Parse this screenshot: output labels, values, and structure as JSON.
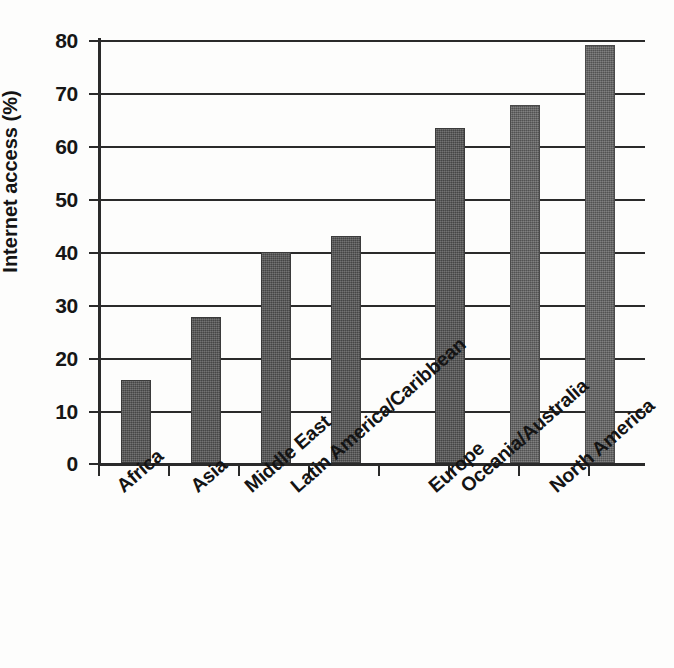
{
  "chart_data": {
    "type": "bar",
    "title": "",
    "subtitle": "",
    "xlabel": "",
    "ylabel": "Internet access (%)",
    "categories": [
      "Africa",
      "Asia",
      "Middle East",
      "Latin America/Caribbean",
      "Europe",
      "Oceania/Australia",
      "North America"
    ],
    "values": [
      15.7,
      27.6,
      40.0,
      43.0,
      63.3,
      67.8,
      79.0
    ],
    "ylim": [
      0,
      80
    ],
    "ytick_labels": [
      "80",
      "70",
      "60",
      "50",
      "40",
      "30",
      "20",
      "10",
      "0"
    ],
    "ytick_values": [
      80,
      70,
      60,
      50,
      40,
      30,
      20,
      10,
      0
    ],
    "grid": "horizontal",
    "legend": "none",
    "bar_color": "#545454",
    "bar_color_light": "#646464",
    "axis_color": "#2a2a2a",
    "background": "#fdfdfc",
    "annotations": []
  }
}
